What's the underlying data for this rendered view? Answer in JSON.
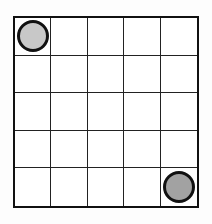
{
  "grid": {
    "rows": 5,
    "cols": 5,
    "line_color": "#222222",
    "border_color": "#111111",
    "background": "#ffffff"
  },
  "tokens": [
    {
      "name": "token-light",
      "row": 0,
      "col": 0,
      "fill": "#c8c8c8"
    },
    {
      "name": "token-dark",
      "row": 4,
      "col": 4,
      "fill": "#a2a2a2"
    }
  ]
}
